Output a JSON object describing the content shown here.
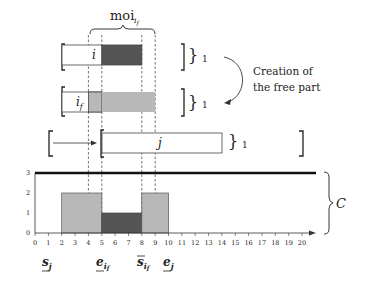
{
  "title_brace": {
    "label": "moi",
    "subscript": "i_f"
  },
  "activities": [
    {
      "id": "i",
      "label": "i",
      "height_label": "1"
    },
    {
      "id": "i_f",
      "label": "i",
      "label_sub": "f",
      "height_label": "1"
    },
    {
      "id": "j",
      "label": "j",
      "height_label": "1"
    }
  ],
  "annotation": {
    "line1": "Creation of",
    "line2": "the free part"
  },
  "resource": {
    "label": "C",
    "capacity": 3
  },
  "y_ticks": [
    "0",
    "1",
    "2",
    "3"
  ],
  "x_ticks": [
    "0",
    "1",
    "2",
    "3",
    "4",
    "5",
    "6",
    "7",
    "8",
    "9",
    "10",
    "11",
    "12",
    "13",
    "14",
    "15",
    "16",
    "17",
    "18",
    "19",
    "20"
  ],
  "x_markers": [
    {
      "id": "s_j",
      "base": "s",
      "sub": "j",
      "decoration": "underline",
      "x": 1
    },
    {
      "id": "e_if",
      "base": "e",
      "sub": "i_f",
      "decoration": "underline",
      "x": 5
    },
    {
      "id": "s_if",
      "base": "s",
      "sub": "i_f",
      "decoration": "overline",
      "x": 8
    },
    {
      "id": "e_j",
      "base": "e",
      "sub": "j",
      "decoration": "underline",
      "x": 10
    }
  ],
  "profile": [
    {
      "from": 2,
      "to": 5,
      "height": 2,
      "color": "#b8b8b8"
    },
    {
      "from": 5,
      "to": 8,
      "height": 1,
      "color": "#555555"
    },
    {
      "from": 8,
      "to": 10,
      "height": 2,
      "color": "#b8b8b8"
    }
  ],
  "colors": {
    "dark": "#555555",
    "light": "#b8b8b8",
    "line": "#222222"
  }
}
